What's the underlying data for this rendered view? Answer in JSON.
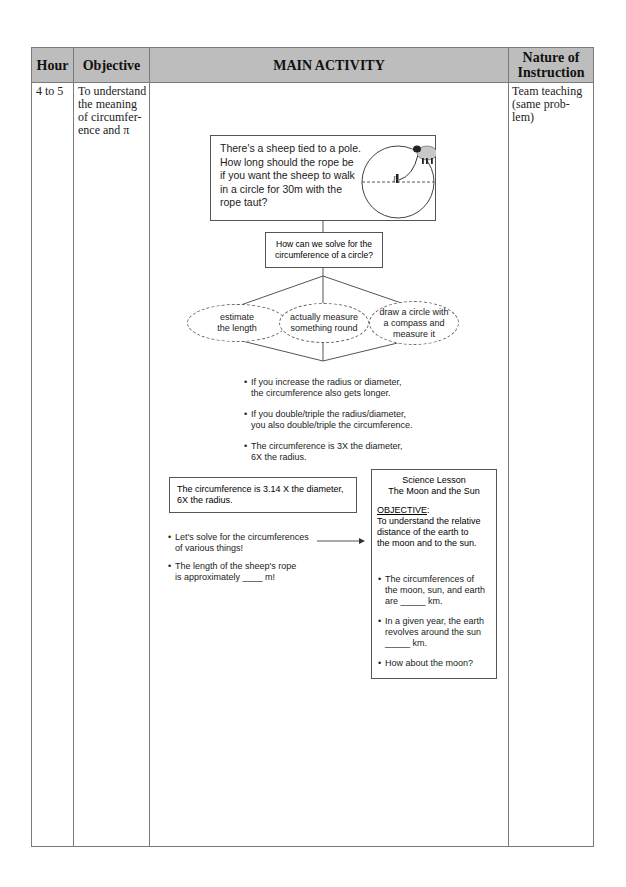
{
  "table": {
    "headers": {
      "hour": "Hour",
      "objective": "Objective",
      "main_activity": "MAIN ACTIVITY",
      "nature_line1": "Nature of",
      "nature_line2": "Instruction"
    },
    "row": {
      "hour": "4 to 5",
      "objective_lines": [
        "To understand",
        "the meaning",
        "of circumfer-",
        "ence and π"
      ],
      "nature_lines": [
        "Team teaching",
        "(same prob-",
        "lem)"
      ]
    }
  },
  "main_activity": {
    "sheep_problem": {
      "lines": [
        "There's a sheep tied to a pole.",
        "How long should the rope be",
        "if you want the sheep to walk",
        "in a circle for 30m with the",
        "rope taut?"
      ],
      "diagram_label": "l",
      "icons": [
        "sheep-icon",
        "pole-icon",
        "circle-diagram"
      ]
    },
    "question_box": {
      "lines": [
        "How can we solve for the",
        "circumference of a circle?"
      ]
    },
    "approaches": [
      {
        "lines": [
          "estimate",
          "the length"
        ]
      },
      {
        "lines": [
          "actually measure",
          "something round"
        ]
      },
      {
        "lines": [
          "draw a circle with",
          "a compass and",
          "measure it"
        ]
      }
    ],
    "findings": [
      {
        "lines": [
          "If you increase the radius or diameter,",
          "the circumference also gets longer."
        ]
      },
      {
        "lines": [
          "If you double/triple the radius/diameter,",
          "you also double/triple the circumference."
        ]
      },
      {
        "lines": [
          "The circumference is 3X the diameter,",
          "6X the radius."
        ]
      }
    ],
    "pi_box": {
      "lines": [
        "The circumference is 3.14 X the diameter,",
        "6X the radius."
      ]
    },
    "next_steps": [
      {
        "lines": [
          "Let's solve for the circumferences",
          "of various things!"
        ]
      },
      {
        "lines": [
          "The length of the sheep's rope",
          "is approximately ____ m!"
        ]
      }
    ],
    "science_lesson": {
      "title_line1": "Science Lesson",
      "title_line2": "The Moon and the Sun",
      "objective_label": "OBJECTIVE",
      "objective_colon": ":",
      "objective_lines": [
        "To understand the relative",
        "distance of the earth to",
        "the moon and to the sun."
      ],
      "bullets": [
        {
          "lines": [
            "The circumferences of",
            "the moon, sun, and earth",
            "are _____ km."
          ]
        },
        {
          "lines": [
            "In a given year, the earth",
            "revolves around the sun",
            "_____ km."
          ]
        },
        {
          "lines": [
            "How about the moon?"
          ]
        }
      ]
    },
    "bullet_glyph": "•"
  },
  "colors": {
    "header_bg": "#bdbdbd",
    "border": "#7a7a7a",
    "sheep_body": "#c8c8c8"
  }
}
